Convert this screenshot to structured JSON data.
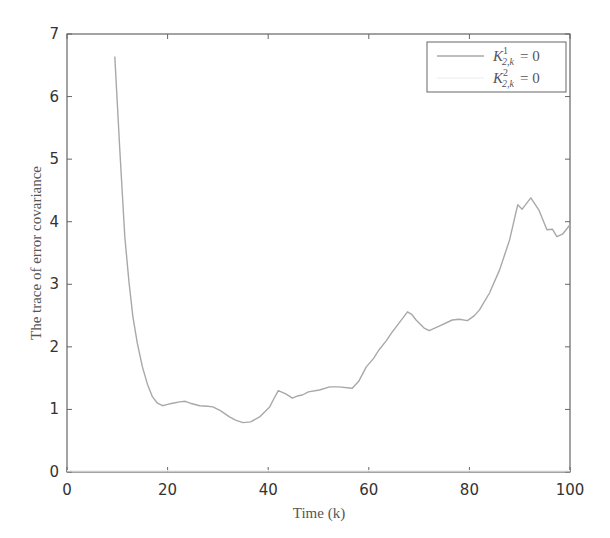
{
  "chart_data": {
    "type": "line",
    "title": "",
    "xlabel": "Time (k)",
    "ylabel": "The trace of error covariance",
    "xlim": [
      0,
      100
    ],
    "ylim": [
      0,
      7
    ],
    "xticks": [
      0,
      20,
      40,
      60,
      80,
      100
    ],
    "yticks": [
      0,
      1,
      2,
      3,
      4,
      5,
      6,
      7
    ],
    "grid": false,
    "legend_position": "upper right",
    "series": [
      {
        "name": "K^1_{2,k} = 0",
        "legend_label": "K",
        "legend_sup": "1",
        "legend_sub": "2,k",
        "legend_rhs": "= 0",
        "color": "#a8a8a8",
        "x": [
          9.5,
          10.5,
          11.5,
          12.3,
          13.1,
          14,
          15,
          16,
          17,
          18,
          19,
          20,
          21,
          22.4,
          23.5,
          24.5,
          26.4,
          28,
          29,
          30.5,
          32.3,
          33.5,
          35,
          36.5,
          38.3,
          40.3,
          41,
          42,
          43.5,
          44.8,
          46,
          46.8,
          48,
          50.2,
          52.2,
          54,
          56.7,
          58,
          59.5,
          61,
          62,
          63.5,
          64.5,
          66,
          67.7,
          68.5,
          69.4,
          71,
          72,
          74,
          76.6,
          78,
          79.6,
          81,
          82,
          84,
          86,
          88,
          89.6,
          90.5,
          92.2,
          93.8,
          95.4,
          96.5,
          97.4,
          98.5,
          100
        ],
        "y": [
          6.64,
          5.15,
          3.76,
          3.05,
          2.48,
          2.05,
          1.68,
          1.4,
          1.2,
          1.1,
          1.06,
          1.08,
          1.1,
          1.12,
          1.13,
          1.1,
          1.06,
          1.05,
          1.04,
          0.98,
          0.88,
          0.83,
          0.79,
          0.8,
          0.88,
          1.04,
          1.15,
          1.3,
          1.25,
          1.18,
          1.22,
          1.23,
          1.28,
          1.31,
          1.36,
          1.36,
          1.34,
          1.45,
          1.68,
          1.82,
          1.95,
          2.1,
          2.22,
          2.38,
          2.56,
          2.52,
          2.43,
          2.3,
          2.26,
          2.33,
          2.43,
          2.44,
          2.42,
          2.5,
          2.59,
          2.86,
          3.23,
          3.71,
          4.27,
          4.2,
          4.38,
          4.19,
          3.87,
          3.88,
          3.76,
          3.8,
          3.95
        ]
      },
      {
        "name": "K^2_{2,k} = 0",
        "legend_label": "K",
        "legend_sup": "2",
        "legend_sub": "2,k",
        "legend_rhs": "= 0",
        "color": "#f2f2f2",
        "x": [
          0,
          20,
          40,
          60,
          80,
          100
        ],
        "y": [
          0.02,
          0.02,
          0.02,
          0.02,
          0.02,
          0.02
        ]
      }
    ]
  }
}
